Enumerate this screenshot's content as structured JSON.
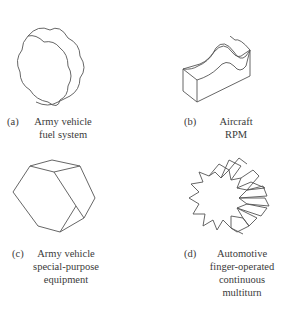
{
  "figure": {
    "panels": [
      {
        "id": "a",
        "label": "(a)",
        "lines": [
          "Army vehicle",
          "fuel system"
        ],
        "shape": "wavy-octagon-knob"
      },
      {
        "id": "b",
        "label": "(b)",
        "lines": [
          "Aircraft",
          "RPM"
        ],
        "shape": "wavy-top-bar-knob"
      },
      {
        "id": "c",
        "label": "(c)",
        "lines": [
          "Army vehicle",
          "special-purpose",
          "equipment"
        ],
        "shape": "hexagonal-prism-knob"
      },
      {
        "id": "d",
        "label": "(d)",
        "lines": [
          "Automotive",
          "finger-operated",
          "continuous",
          "multiturn"
        ],
        "shape": "knurled-gear-knob"
      }
    ]
  }
}
